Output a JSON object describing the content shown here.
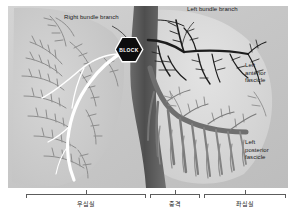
{
  "figure": {
    "background_color": "#c9c9c9",
    "labels": {
      "right_bundle_branch": "Right bundle branch",
      "left_bundle_branch": "Left bundle branch",
      "left_anterior_fascicle": "Left\nanterior\nfascicle",
      "left_posterior_fascicle": "Left\nposterior\nfascicle",
      "block_badge": "BLOCK"
    },
    "colors": {
      "right_bundle": "#ffffff",
      "left_bundle": "#1c1c1c",
      "posterior_fascicle": "#7a7a7a",
      "septum": "#5a5a5a",
      "ventricle_fill": "#d9d9d9",
      "fiber": "#8d8d8d",
      "badge_fill": "#0d0d0d",
      "badge_text": "#ffffff",
      "label_text": "#1a1a1a",
      "bracket": "#5c5c5c"
    }
  },
  "brackets": [
    {
      "caption": "우심실"
    },
    {
      "caption": "중격"
    },
    {
      "caption": "좌심실"
    }
  ]
}
